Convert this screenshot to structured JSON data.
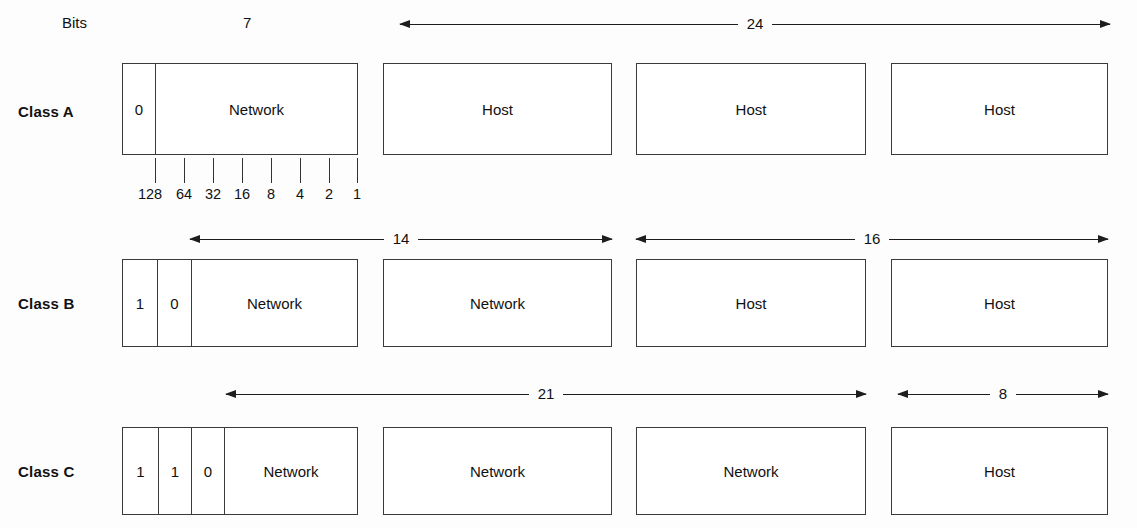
{
  "figure": {
    "bits_caption": "Bits",
    "classes": [
      {
        "id": "class-a",
        "label": "Class A",
        "octets": [
          {
            "segments": [
              {
                "text": "0",
                "kind": "bit"
              },
              {
                "text": "Network",
                "kind": "field"
              }
            ]
          },
          {
            "segments": [
              {
                "text": "Host",
                "kind": "field"
              }
            ]
          },
          {
            "segments": [
              {
                "text": "Host",
                "kind": "field"
              }
            ]
          },
          {
            "segments": [
              {
                "text": "Host",
                "kind": "field"
              }
            ]
          }
        ],
        "spans": [
          {
            "value": "7",
            "style": "plain"
          },
          {
            "value": "24",
            "style": "double-arrow"
          }
        ]
      },
      {
        "id": "class-b",
        "label": "Class B",
        "octets": [
          {
            "segments": [
              {
                "text": "1",
                "kind": "bit"
              },
              {
                "text": "0",
                "kind": "bit"
              },
              {
                "text": "Network",
                "kind": "field"
              }
            ]
          },
          {
            "segments": [
              {
                "text": "Network",
                "kind": "field"
              }
            ]
          },
          {
            "segments": [
              {
                "text": "Host",
                "kind": "field"
              }
            ]
          },
          {
            "segments": [
              {
                "text": "Host",
                "kind": "field"
              }
            ]
          }
        ],
        "spans": [
          {
            "value": "14",
            "style": "double-arrow"
          },
          {
            "value": "16",
            "style": "double-arrow"
          }
        ]
      },
      {
        "id": "class-c",
        "label": "Class C",
        "octets": [
          {
            "segments": [
              {
                "text": "1",
                "kind": "bit"
              },
              {
                "text": "1",
                "kind": "bit"
              },
              {
                "text": "0",
                "kind": "bit"
              },
              {
                "text": "Network",
                "kind": "field"
              }
            ]
          },
          {
            "segments": [
              {
                "text": "Network",
                "kind": "field"
              }
            ]
          },
          {
            "segments": [
              {
                "text": "Network",
                "kind": "field"
              }
            ]
          },
          {
            "segments": [
              {
                "text": "Host",
                "kind": "field"
              }
            ]
          }
        ],
        "spans": [
          {
            "value": "21",
            "style": "double-arrow"
          },
          {
            "value": "8",
            "style": "double-arrow"
          }
        ]
      }
    ],
    "bit_ruler": {
      "labels": [
        "128",
        "64",
        "32",
        "16",
        "8",
        "4",
        "2",
        "1"
      ]
    },
    "colors": {
      "stroke": "#3a3a3a",
      "arrow": "#1d1d1d",
      "text": "#111111",
      "background": "#fdfdfd"
    }
  }
}
